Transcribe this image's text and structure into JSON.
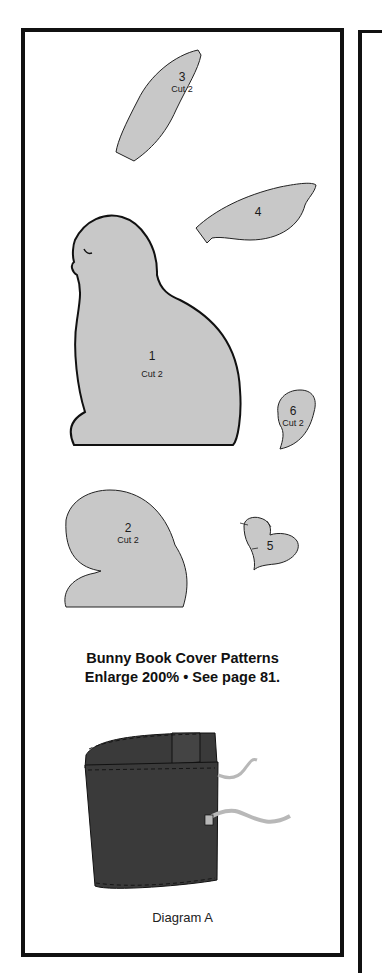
{
  "page": {
    "title_line1": "Bunny Book Cover Patterns",
    "title_line2": "Enlarge 200% • See page 81.",
    "diagram_caption": "Diagram A"
  },
  "pieces": [
    {
      "id": "piece-1",
      "number": "1",
      "instruction": "Cut 2",
      "shape": "bunny-body"
    },
    {
      "id": "piece-2",
      "number": "2",
      "instruction": "Cut 2",
      "shape": "head-mitten"
    },
    {
      "id": "piece-3",
      "number": "3",
      "instruction": "Cut 2",
      "shape": "ear"
    },
    {
      "id": "piece-4",
      "number": "4",
      "instruction": "",
      "shape": "ear"
    },
    {
      "id": "piece-5",
      "number": "5",
      "instruction": "",
      "shape": "heart"
    },
    {
      "id": "piece-6",
      "number": "6",
      "instruction": "Cut 2",
      "shape": "tail"
    }
  ],
  "colors": {
    "pattern_fill": "#c8c8c8",
    "outline": "#111111",
    "cover_fill": "#3a3a3a",
    "ribbon_fill": "#b8b8b8"
  }
}
